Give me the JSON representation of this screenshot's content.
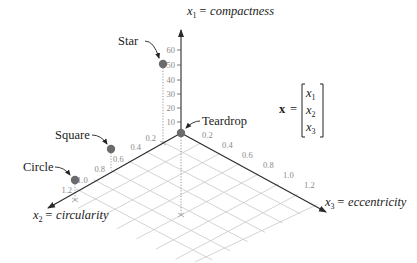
{
  "figure": {
    "axes": {
      "x1": {
        "label_var": "x",
        "label_sub": "1",
        "label_text": "= compactness",
        "ticks": [
          "10",
          "20",
          "30",
          "40",
          "50",
          "60"
        ]
      },
      "x2": {
        "label_var": "x",
        "label_sub": "2",
        "label_text": "= circularity",
        "ticks": [
          "0.2",
          "0.4",
          "0.6",
          "0.8",
          "1.0",
          "1.2"
        ]
      },
      "x3": {
        "label_var": "x",
        "label_sub": "3",
        "label_text": "= eccentricity",
        "ticks": [
          "0.2",
          "0.4",
          "0.6",
          "0.8",
          "1.0",
          "1.2"
        ]
      }
    },
    "points": [
      {
        "name": "Star"
      },
      {
        "name": "Teardrop"
      },
      {
        "name": "Square"
      },
      {
        "name": "Circle"
      }
    ],
    "vector": {
      "symbol": "x",
      "equals": "=",
      "components": [
        {
          "var": "x",
          "sub": "1"
        },
        {
          "var": "x",
          "sub": "2"
        },
        {
          "var": "x",
          "sub": "3"
        }
      ]
    },
    "colors": {
      "axis": "#2a2a2a",
      "grid": "#c9c9c9",
      "point": "#6b6b6b",
      "tick_label": "#8a8a8a"
    }
  }
}
